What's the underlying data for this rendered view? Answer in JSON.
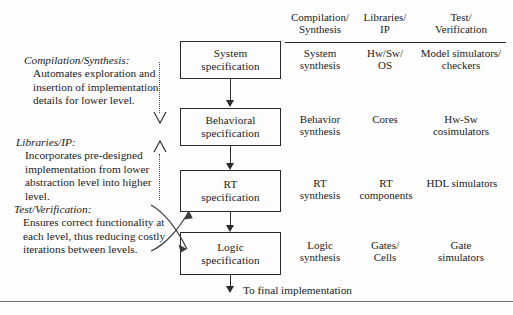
{
  "diagram": {
    "flow_boxes": [
      {
        "id": "system",
        "line1": "System",
        "line2": "specification"
      },
      {
        "id": "behavioral",
        "line1": "Behavioral",
        "line2": "specification"
      },
      {
        "id": "rt",
        "line1": "RT",
        "line2": "specification"
      },
      {
        "id": "logic",
        "line1": "Logic",
        "line2": "specification"
      }
    ],
    "final_arrow_label": "To final implementation",
    "columns": [
      {
        "id": "compilation-synthesis",
        "head_line1": "Compilation/",
        "head_line2": "Synthesis"
      },
      {
        "id": "libraries-ip",
        "head_line1": "Libraries/",
        "head_line2": "IP"
      },
      {
        "id": "test-verification",
        "head_line1": "Test/",
        "head_line2": "Verification"
      }
    ],
    "rows": [
      {
        "level": "system",
        "cells": [
          {
            "line1": "System",
            "line2": "synthesis"
          },
          {
            "line1": "Hw/Sw/",
            "line2": "OS"
          },
          {
            "line1": "Model simulators/",
            "line2": "checkers"
          }
        ]
      },
      {
        "level": "behavioral",
        "cells": [
          {
            "line1": "Behavior",
            "line2": "synthesis"
          },
          {
            "line1": "Cores",
            "line2": ""
          },
          {
            "line1": "Hw-Sw",
            "line2": "cosimulators"
          }
        ]
      },
      {
        "level": "rt",
        "cells": [
          {
            "line1": "RT",
            "line2": "synthesis"
          },
          {
            "line1": "RT",
            "line2": "components"
          },
          {
            "line1": "HDL simulators",
            "line2": ""
          }
        ]
      },
      {
        "level": "logic",
        "cells": [
          {
            "line1": "Logic",
            "line2": "synthesis"
          },
          {
            "line1": "Gates/",
            "line2": "Cells"
          },
          {
            "line1": "Gate",
            "line2": "simulators"
          }
        ]
      }
    ],
    "legend": [
      {
        "id": "compilation-synthesis",
        "term": "Compilation/Synthesis:",
        "body": " Automates exploration and insertion of implementation details for lower level."
      },
      {
        "id": "libraries-ip",
        "term": "Libraries/IP:",
        "body": " Incorporates pre-designed implementation from lower abstraction level into higher level."
      },
      {
        "id": "test-verification",
        "term": "Test/Verification:",
        "body": " Ensures correct functionality at each level, thus reducing costly iterations between levels."
      }
    ],
    "colors": {
      "ink": "#1b1b1b",
      "line": "#2a2a2a",
      "dotted": "#4a4a4a",
      "background": "#fefefe"
    }
  }
}
